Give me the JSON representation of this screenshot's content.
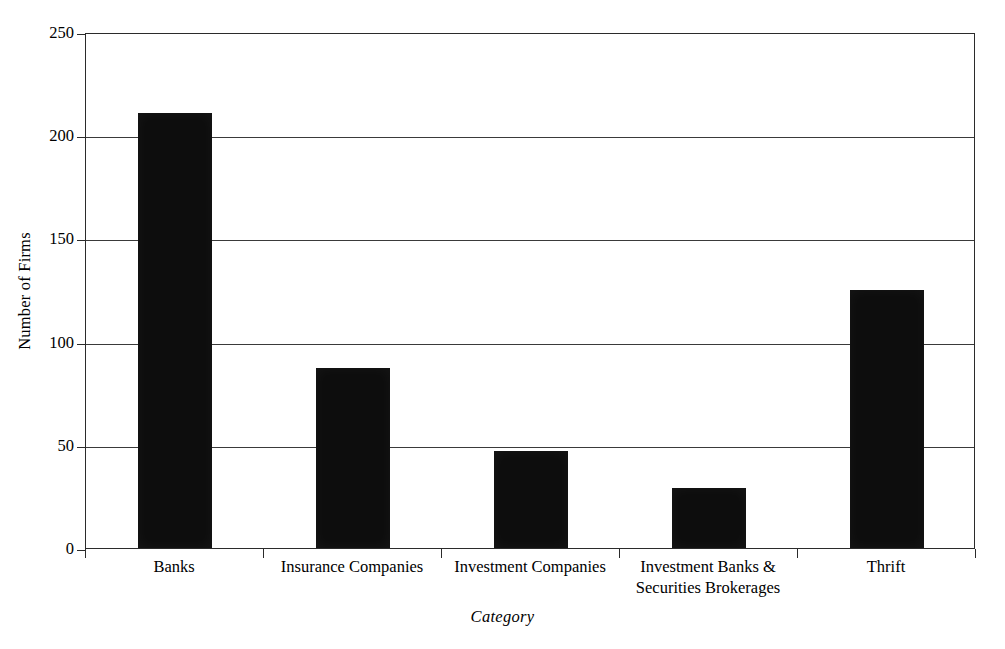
{
  "chart_data": {
    "type": "bar",
    "title": "",
    "xlabel": "Category",
    "ylabel": "Number of Firms",
    "categories": [
      "Banks",
      "Insurance Companies",
      "Investment Companies",
      "Investment Banks  &\nSecurities Brokerages",
      "Thrift"
    ],
    "values": [
      211,
      87,
      47,
      29,
      125
    ],
    "ylim": [
      0,
      250
    ],
    "yticks": [
      0,
      50,
      100,
      150,
      200,
      250
    ],
    "ytick_labels": [
      "0",
      "50",
      "100",
      "150",
      "200",
      "250"
    ],
    "grid": "horizontal",
    "legend": "none",
    "bar_color": "#0d0d0d",
    "axis_color": "#2b2b2b",
    "background_color": "#ffffff"
  }
}
